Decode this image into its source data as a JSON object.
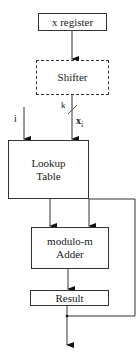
{
  "diagram": {
    "nodes": {
      "x_register": "x register",
      "shifter": "Shifter",
      "lookup_line1": "Lookup",
      "lookup_line2": "Table",
      "adder_line1": "modulo-m",
      "adder_line2": "Adder",
      "result": "Result"
    },
    "labels": {
      "i": "i",
      "k": "k",
      "x": "x",
      "x_sub": "i"
    },
    "colors": {
      "stroke": "#333333",
      "background": "#ffffff"
    }
  }
}
